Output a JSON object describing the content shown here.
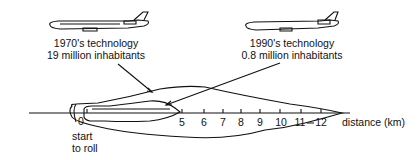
{
  "diagram": {
    "planes": [
      {
        "label_line1": "1970's technology",
        "label_line2": "19 million inhabitants"
      },
      {
        "label_line1": "1990's technology",
        "label_line2": "0.8 million inhabitants"
      }
    ],
    "axis": {
      "origin_label": "0",
      "ticks": [
        "5",
        "6",
        "7",
        "8",
        "9",
        "10",
        "11",
        "12"
      ],
      "unit_label": "distance (km)",
      "start_label_line1": "start",
      "start_label_line2": "to roll"
    },
    "colors": {
      "ink": "#111111",
      "background": "#ffffff"
    }
  }
}
